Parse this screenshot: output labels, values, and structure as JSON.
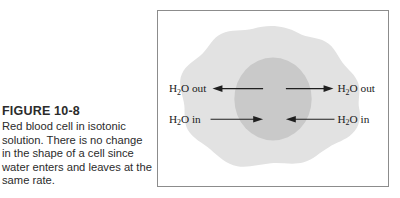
{
  "figure": {
    "number": "FIGURE 10-8",
    "caption": "Red blood cell in isotonic solution. There is no change in the shape of a cell since water enters and leaves at the same rate."
  },
  "diagram": {
    "colors": {
      "background": "#ffffff",
      "frame_border": "#8c8c8c",
      "cytoplasm": "#e2e2e2",
      "nucleus": "#c9c9c9",
      "arrow": "#1f1f1f",
      "label_text": "#1a1a1a",
      "caption_text": "#2b2b2b"
    },
    "labels": [
      {
        "id": "water-out-left",
        "formula": "H",
        "subscript": "2",
        "formula_tail": "O",
        "direction_word": "out",
        "full_text": "H2O out",
        "position": "top-left",
        "arrow_direction": "left"
      },
      {
        "id": "water-out-right",
        "formula": "H",
        "subscript": "2",
        "formula_tail": "O",
        "direction_word": "out",
        "full_text": "H2O out",
        "position": "top-right",
        "arrow_direction": "right"
      },
      {
        "id": "water-in-left",
        "formula": "H",
        "subscript": "2",
        "formula_tail": "O",
        "direction_word": "in",
        "full_text": "H2O in",
        "position": "bottom-left",
        "arrow_direction": "right"
      },
      {
        "id": "water-in-right",
        "formula": "H",
        "subscript": "2",
        "formula_tail": "O",
        "direction_word": "in",
        "full_text": "H2O in",
        "position": "bottom-right",
        "arrow_direction": "left"
      }
    ]
  }
}
